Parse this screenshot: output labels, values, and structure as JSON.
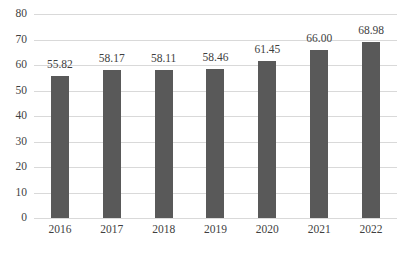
{
  "chart_data": {
    "type": "bar",
    "title": "",
    "subtitle": "",
    "xlabel": "",
    "ylabel": "",
    "categories": [
      "2016",
      "2017",
      "2018",
      "2019",
      "2020",
      "2021",
      "2022"
    ],
    "values": [
      55.82,
      58.17,
      58.11,
      58.46,
      61.45,
      66.0,
      68.98
    ],
    "data_labels": [
      "55.82",
      "58.17",
      "58.11",
      "58.46",
      "61.45",
      "66.00",
      "68.98"
    ],
    "ylim": [
      0,
      80
    ],
    "ytick_step": 10,
    "ytick_labels": [
      "0",
      "10",
      "20",
      "30",
      "40",
      "50",
      "60",
      "70",
      "80"
    ],
    "ytick_values": [
      0,
      10,
      20,
      30,
      40,
      50,
      60,
      70,
      80
    ],
    "grid": "horizontal",
    "legend": "none",
    "series": [
      {
        "name": "",
        "values": [
          55.82,
          58.17,
          58.11,
          58.46,
          61.45,
          66.0,
          68.98
        ]
      }
    ]
  },
  "style": {
    "bar_color": "#595959",
    "gridline_color": "#d9d9d9",
    "text_color": "#3f3f3f",
    "background_color": "#ffffff"
  }
}
